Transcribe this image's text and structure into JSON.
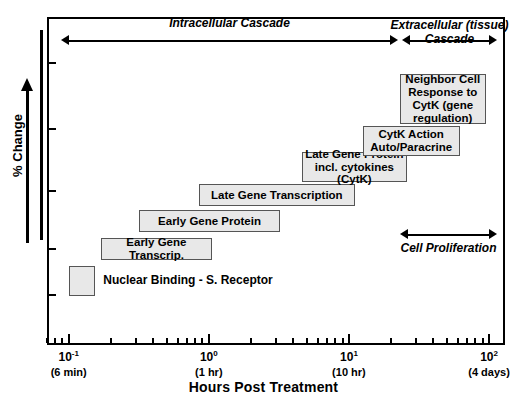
{
  "figure": {
    "title_x": "Hours Post Treatment",
    "ylabel": "% Change"
  },
  "axes": {
    "x_tick_labels": [
      {
        "value": "10",
        "exp": "-1",
        "sub": "(6 min)",
        "x": 0.1
      },
      {
        "value": "10",
        "exp": "0",
        "sub": "(1 hr)",
        "x": 1
      },
      {
        "value": "10",
        "exp": "1",
        "sub": "(10 hr)",
        "x": 10
      },
      {
        "value": "10",
        "exp": "2",
        "sub": "(4 days)",
        "x": 100
      }
    ],
    "x_range": [
      0.07,
      130
    ],
    "x_scale": "log",
    "y_ticks_count": 5,
    "grid": false
  },
  "annotations": {
    "intracellular": "Intracellular Cascade",
    "extracellular": "Extracellular (tissue)\nCascade",
    "proliferation": "Cell Proliferation"
  },
  "chart_data": {
    "type": "bar",
    "orientation": "horizontal-timeline",
    "title": "",
    "xlabel": "Hours Post Treatment",
    "ylabel": "% Change",
    "xscale": "log",
    "xlim": [
      0.07,
      130
    ],
    "xtick_values": [
      0.1,
      1,
      10,
      100
    ],
    "xtick_labels": [
      "10-1",
      "100",
      "101",
      "102"
    ],
    "xtick_sublabels": [
      "(6 min)",
      "(1 hr)",
      "(10 hr)",
      "(4 days)"
    ],
    "grid": false,
    "legend": "none",
    "categories": [
      "Nuclear Binding - S. Receptor",
      "Early Gene Transcrip.",
      "Early Gene Protein",
      "Late Gene Transcription",
      "Late Gene Protein incl. cytokines (CytK)",
      "CytK Action Auto/Paracrine",
      "Neighbor Cell Response to CytK (gene regulation)"
    ],
    "bars": [
      {
        "label": "",
        "side_label": "Nuclear Binding - S. Receptor",
        "start_hours": 0.1,
        "end_hours": 0.155,
        "row": 0
      },
      {
        "label": "Early Gene Transcrip.",
        "start_hours": 0.17,
        "end_hours": 1.05,
        "row": 1
      },
      {
        "label": "Early Gene Protein",
        "start_hours": 0.32,
        "end_hours": 3.2,
        "row": 2
      },
      {
        "label": "Late Gene Transcription",
        "start_hours": 0.85,
        "end_hours": 11.0,
        "row": 3
      },
      {
        "label": "Late Gene Protein\nincl. cytokines (CytK)",
        "start_hours": 4.6,
        "end_hours": 26.0,
        "row": 4
      },
      {
        "label": "CytK Action\nAuto/Paracrine",
        "start_hours": 12.5,
        "end_hours": 62.0,
        "row": 5
      },
      {
        "label": "Neighbor Cell\nResponse to\nCytK (gene\nregulation)",
        "start_hours": 23.0,
        "end_hours": 95.0,
        "row": 6
      }
    ],
    "annotation_arrows": [
      {
        "name": "Intracellular Cascade",
        "start_hours": 0.1,
        "end_hours": 14.0
      },
      {
        "name": "Extracellular (tissue) Cascade",
        "start_hours": 15.0,
        "end_hours": 110.0
      },
      {
        "name": "Cell Proliferation",
        "start_hours": 22.0,
        "end_hours": 90.0
      }
    ]
  },
  "colors": {
    "box_fill": "#e8e8e8",
    "box_border": "#555555",
    "axis": "#000000",
    "background": "#ffffff"
  }
}
